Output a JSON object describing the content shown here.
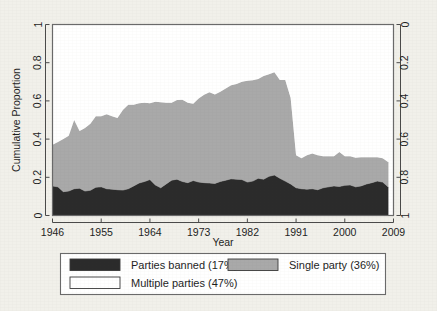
{
  "figure": {
    "background_color": "#f1f0ea",
    "plot_background_color": "#ffffff",
    "frame_color": "#6a6a6a"
  },
  "chart_data": {
    "type": "area",
    "title": "",
    "subtitle": "",
    "xlabel": "Year",
    "ylabel": "Cumulative Proportion",
    "ylabel_right": "",
    "xlim": [
      1946,
      2009
    ],
    "ylim": [
      0,
      1
    ],
    "grid": false,
    "stacked": true,
    "legend_position": "bottom",
    "xticks": [
      1946,
      1955,
      1964,
      1973,
      1982,
      1991,
      2000,
      2009
    ],
    "xticklabels": [
      "1946",
      "1955",
      "1964",
      "1973",
      "1982",
      "1991",
      "2000",
      "2009"
    ],
    "yticks": [
      0,
      0.2,
      0.4,
      0.6,
      0.8,
      1
    ],
    "yticklabels": [
      "0",
      "0.2",
      "0.4",
      "0.6",
      "0.8",
      "1"
    ],
    "yticks_right": [
      0,
      0.2,
      0.4,
      0.6,
      0.8,
      1
    ],
    "yticklabels_right": [
      "0",
      "0.2",
      "0.4",
      "0.6",
      "0.8",
      "1"
    ],
    "right_axis_inverted": true,
    "colors": {
      "parties_banned": "#2b2b2b",
      "single_party": "#a9a9a9",
      "multiple_parties": "#ffffff"
    },
    "x": [
      1946,
      1947,
      1948,
      1949,
      1950,
      1951,
      1952,
      1953,
      1954,
      1955,
      1956,
      1957,
      1958,
      1959,
      1960,
      1961,
      1962,
      1963,
      1964,
      1965,
      1966,
      1967,
      1968,
      1969,
      1970,
      1971,
      1972,
      1973,
      1974,
      1975,
      1976,
      1977,
      1978,
      1979,
      1980,
      1981,
      1982,
      1983,
      1984,
      1985,
      1986,
      1987,
      1988,
      1989,
      1990,
      1991,
      1992,
      1993,
      1994,
      1995,
      1996,
      1997,
      1998,
      1999,
      2000,
      2001,
      2002,
      2003,
      2004,
      2005,
      2006,
      2007,
      2008
    ],
    "series": [
      {
        "name": "Parties banned (17%)",
        "key": "parties_banned",
        "color": "#2b2b2b",
        "share_label": "17%",
        "values": [
          0.155,
          0.15,
          0.125,
          0.128,
          0.14,
          0.143,
          0.128,
          0.132,
          0.148,
          0.15,
          0.14,
          0.138,
          0.135,
          0.133,
          0.14,
          0.155,
          0.17,
          0.178,
          0.188,
          0.16,
          0.145,
          0.165,
          0.185,
          0.19,
          0.178,
          0.172,
          0.183,
          0.175,
          0.172,
          0.17,
          0.168,
          0.178,
          0.185,
          0.192,
          0.19,
          0.188,
          0.175,
          0.18,
          0.195,
          0.19,
          0.205,
          0.212,
          0.195,
          0.18,
          0.165,
          0.145,
          0.14,
          0.138,
          0.14,
          0.135,
          0.145,
          0.15,
          0.155,
          0.152,
          0.158,
          0.16,
          0.15,
          0.155,
          0.165,
          0.172,
          0.18,
          0.175,
          0.15
        ]
      },
      {
        "name": "Single party (36%)",
        "key": "single_party",
        "color": "#a9a9a9",
        "share_label": "36%",
        "values": [
          0.215,
          0.235,
          0.275,
          0.29,
          0.36,
          0.3,
          0.33,
          0.348,
          0.372,
          0.37,
          0.39,
          0.382,
          0.375,
          0.42,
          0.44,
          0.425,
          0.418,
          0.412,
          0.4,
          0.435,
          0.448,
          0.425,
          0.405,
          0.415,
          0.428,
          0.418,
          0.402,
          0.438,
          0.46,
          0.475,
          0.465,
          0.47,
          0.48,
          0.49,
          0.498,
          0.512,
          0.53,
          0.528,
          0.52,
          0.54,
          0.535,
          0.538,
          0.515,
          0.53,
          0.45,
          0.17,
          0.16,
          0.178,
          0.185,
          0.18,
          0.165,
          0.16,
          0.155,
          0.18,
          0.152,
          0.15,
          0.152,
          0.15,
          0.14,
          0.133,
          0.125,
          0.125,
          0.13
        ]
      },
      {
        "name": "Multiple parties (47%)",
        "key": "multiple_parties",
        "color": "#ffffff",
        "share_label": "47%",
        "values": [
          0.63,
          0.615,
          0.6,
          0.582,
          0.5,
          0.557,
          0.542,
          0.52,
          0.48,
          0.48,
          0.47,
          0.48,
          0.49,
          0.447,
          0.42,
          0.42,
          0.412,
          0.41,
          0.412,
          0.405,
          0.407,
          0.41,
          0.41,
          0.395,
          0.394,
          0.41,
          0.415,
          0.387,
          0.368,
          0.355,
          0.367,
          0.352,
          0.335,
          0.318,
          0.312,
          0.3,
          0.295,
          0.292,
          0.285,
          0.27,
          0.26,
          0.25,
          0.29,
          0.29,
          0.385,
          0.685,
          0.7,
          0.684,
          0.675,
          0.685,
          0.69,
          0.69,
          0.69,
          0.668,
          0.69,
          0.69,
          0.698,
          0.695,
          0.695,
          0.695,
          0.695,
          0.7,
          0.72
        ]
      }
    ],
    "annotations": []
  },
  "legend": {
    "entries": [
      {
        "label": "Parties banned (17%)",
        "swatch": "#2b2b2b"
      },
      {
        "label": "Single party (36%)",
        "swatch": "#a9a9a9"
      },
      {
        "label": "Multiple parties (47%)",
        "swatch": "#ffffff"
      }
    ]
  }
}
